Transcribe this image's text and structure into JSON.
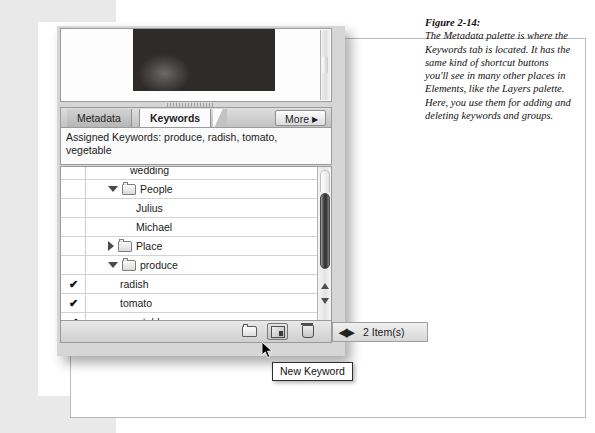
{
  "figure": {
    "number": "Figure 2-14:",
    "caption": "The Metadata palette is where the Keywords tab is located. It has the same kind of shortcut buttons you'll see in many other places in Elements, like the Layers palette. Here, you use them for adding and deleting keywords and groups."
  },
  "palette": {
    "tabs": [
      {
        "label": "Metadata",
        "active": false
      },
      {
        "label": "Keywords",
        "active": true
      }
    ],
    "more_button": {
      "label": "More",
      "arrow": "▶"
    },
    "assigned_keywords": "Assigned Keywords: produce, radish, tomato, vegetable",
    "preview_image_alt": "produce-photo",
    "rows": [
      {
        "label": "wedding",
        "checked": false,
        "twisty": "none",
        "folder": false,
        "indent": 44,
        "clipped": true
      },
      {
        "label": "People",
        "checked": false,
        "twisty": "down",
        "folder": true,
        "indent": 22
      },
      {
        "label": "Julius",
        "checked": false,
        "twisty": "none",
        "folder": false,
        "indent": 50
      },
      {
        "label": "Michael",
        "checked": false,
        "twisty": "none",
        "folder": false,
        "indent": 50
      },
      {
        "label": "Place",
        "checked": false,
        "twisty": "right",
        "folder": true,
        "indent": 22
      },
      {
        "label": "produce",
        "checked": false,
        "twisty": "down",
        "folder": true,
        "indent": 22
      },
      {
        "label": "radish",
        "checked": true,
        "twisty": "none",
        "folder": false,
        "indent": 34
      },
      {
        "label": "tomato",
        "checked": true,
        "twisty": "none",
        "folder": false,
        "indent": 34
      },
      {
        "label": "vegetable",
        "checked": true,
        "twisty": "none",
        "folder": false,
        "indent": 34
      }
    ],
    "check_glyph": "✔",
    "toolbar": {
      "new_group_label": "New Keyword Set",
      "new_keyword_label": "New Keyword",
      "delete_label": "Delete Keyword"
    },
    "status": {
      "resize_glyph": "◀▶",
      "item_count_text": "2 Item(s)"
    }
  },
  "tooltip": {
    "text": "New Keyword"
  },
  "colors": {
    "page_background": "#e9e9e9",
    "sheet": "#ffffff",
    "palette_chrome": "#d6d6d6",
    "active_tab": "#fbfbfb",
    "text": "#1a1a1a"
  }
}
